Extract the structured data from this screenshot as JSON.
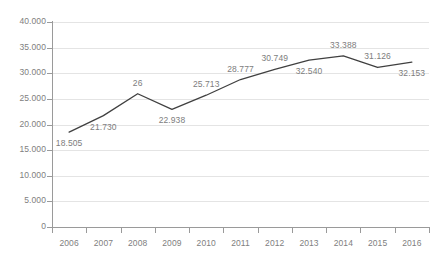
{
  "chart_data": {
    "type": "line",
    "title": "",
    "subtitle": "",
    "xlabel": "",
    "ylabel": "",
    "categories": [
      "2006",
      "2007",
      "2008",
      "2009",
      "2010",
      "2011",
      "2012",
      "2013",
      "2014",
      "2015",
      "2016"
    ],
    "values": [
      18.505,
      21.73,
      26.0,
      22.938,
      25.713,
      28.777,
      30.749,
      32.54,
      33.388,
      31.126,
      32.153
    ],
    "point_labels": [
      "18.505",
      "21.730",
      "26",
      "22.938",
      "25.713",
      "28.777",
      "30.749",
      "32.540",
      "33.388",
      "31.126",
      "32.153"
    ],
    "label_positions": [
      "below",
      "below",
      "above",
      "below",
      "above",
      "above",
      "above",
      "below",
      "above",
      "above",
      "below"
    ],
    "ylim": [
      0,
      40
    ],
    "ytick_values": [
      0,
      5,
      10,
      15,
      20,
      25,
      30,
      35,
      40
    ],
    "ytick_labels": [
      "0",
      "5.000",
      "10.000",
      "15.000",
      "20.000",
      "25.000",
      "30.000",
      "35.000",
      "40.000"
    ],
    "grid": "horizontal",
    "legend": "none",
    "series": [
      {
        "name": "series-1",
        "values": [
          18.505,
          21.73,
          26.0,
          22.938,
          25.713,
          28.777,
          30.749,
          32.54,
          33.388,
          31.126,
          32.153
        ]
      }
    ],
    "colors": {
      "line": "#404040",
      "grid": "#e4e4e4",
      "axis": "#9a9a9a",
      "tick_text": "#808080",
      "label_text": "#7d7d7d",
      "background": "#ffffff"
    }
  }
}
